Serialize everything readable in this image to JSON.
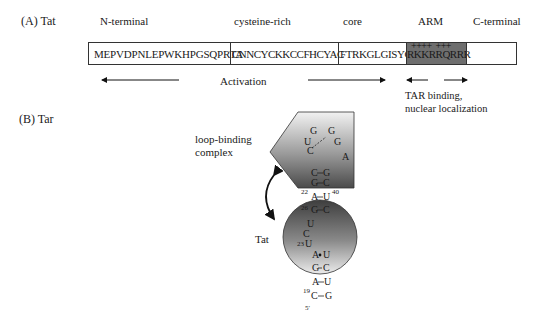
{
  "panel_a": {
    "label": "(A)  Tat",
    "regions": [
      {
        "name": "N-terminal",
        "label": "N-terminal"
      },
      {
        "name": "cysteine-rich",
        "label": "cysteine-rich"
      },
      {
        "name": "core",
        "label": "core"
      },
      {
        "name": "arm",
        "label": "ARM"
      },
      {
        "name": "c-terminal",
        "label": "C-terminal"
      }
    ],
    "sequence": {
      "n_terminal": "MEPVDPNLEPWKHPGSQPRTA",
      "cysteine_rich": "CNNCYCKKCCFHCYAC",
      "core": "FTRKGLGISYG",
      "arm": "RKKRRQRRR",
      "arm_charges": "++++  +++"
    },
    "annotations": {
      "activation": "Activation",
      "tar_binding_line1": "TAR binding,",
      "tar_binding_line2": "nuclear localization"
    }
  },
  "panel_b": {
    "label": "(B)  Tar",
    "loop_binding_label_line1": "loop-binding",
    "loop_binding_label_line2": "complex",
    "tat_label": "Tat",
    "loop": {
      "nucleotides": [
        "G",
        "G",
        "U",
        "G",
        "C",
        "A"
      ]
    },
    "stem_upper": [
      [
        "C",
        "G"
      ],
      [
        "G",
        "C"
      ]
    ],
    "stem_lower": [
      [
        "A",
        "U"
      ],
      [
        "G",
        "C"
      ]
    ],
    "bulge": [
      "U",
      "C",
      "U"
    ],
    "stem_bottom": [
      [
        "A",
        "U"
      ],
      [
        "G",
        "C"
      ],
      [
        "A",
        "U"
      ],
      [
        "C",
        "G"
      ]
    ],
    "numbers": {
      "n22": "22",
      "n40": "40",
      "n26": "26",
      "n23": "23",
      "n19": "19",
      "five_prime": "5′"
    }
  }
}
